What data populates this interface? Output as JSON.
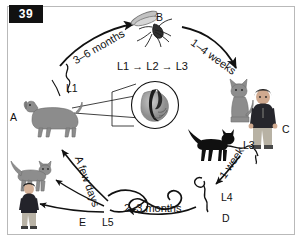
{
  "figure": {
    "plate_number": "39",
    "background_color": "#ffffff",
    "border_color": "#b9b9b9",
    "ink_color": "#111111"
  },
  "labels": {
    "duration_dog_to_mosquito": "3–6 months",
    "duration_mosquito_to_cat": "1–4 weeks",
    "larval_development_in_mosquito": "L1 → L2 → L3",
    "duration_host_to_l4": "1 week",
    "duration_l4_to_l5": "2–3 months",
    "duration_l5_to_hosts": "A few days",
    "stage_l1": "L1",
    "stage_l3": "L3",
    "stage_l4": "L4",
    "stage_l5": "L5"
  },
  "keys": {
    "a": "A",
    "b": "B",
    "c": "C",
    "d": "D",
    "e": "E"
  },
  "organisms": {
    "dog": "dog",
    "mosquito": "mosquito",
    "sitting_cat": "sitting-cat",
    "walking_black_cat": "walking-black-cat",
    "standing_person": "standing-person",
    "left_cat": "left-cat",
    "left_person": "left-person",
    "heart_inset": "heart-with-adult-worms",
    "microfilaria": "microfilaria",
    "larva_l4": "larva-l4",
    "larva_l5": "larva-l5"
  }
}
